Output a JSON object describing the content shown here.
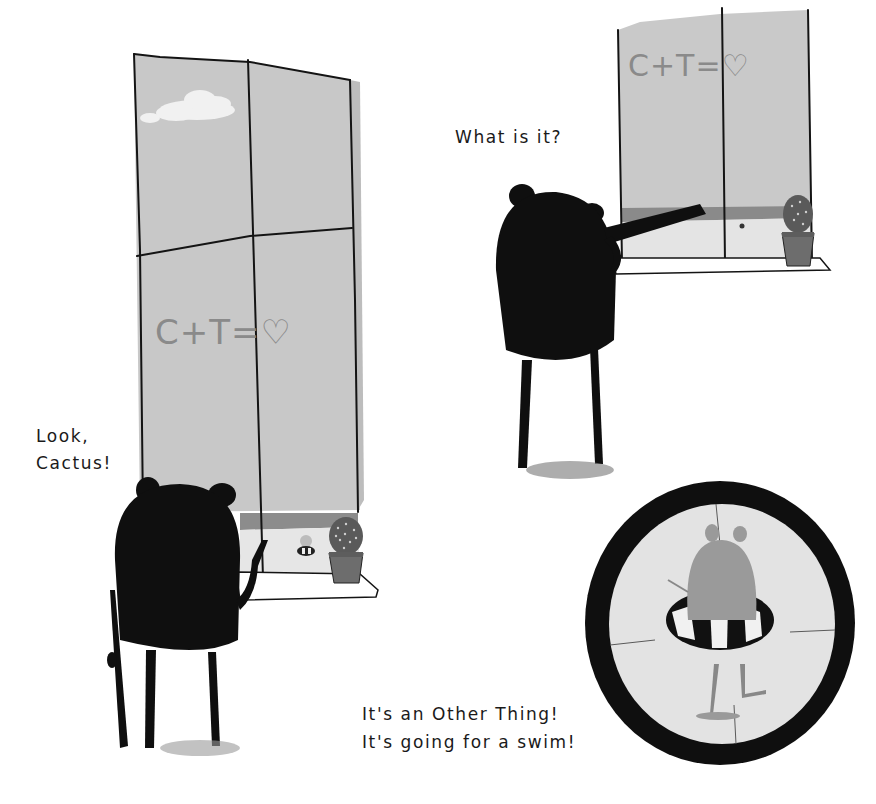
{
  "page": {
    "type": "picture-book spread",
    "captions": {
      "look": {
        "line1": "Look,",
        "line2": "Cactus!"
      },
      "what": {
        "line1": "What is it?"
      },
      "other": {
        "line1": "It's an Other Thing!",
        "line2": "It's going for a swim!"
      }
    },
    "window_graffiti": "C+T=♡",
    "scenes": [
      {
        "name": "window-left",
        "description": "Tall window with cloud, beach view, bear pointing, cactus pot"
      },
      {
        "name": "window-right",
        "description": "Window with bear looking through telescope, cactus pot"
      },
      {
        "name": "telescope-view",
        "description": "Circular telescope view of creature in striped swim ring"
      }
    ],
    "colors": {
      "ink": "#111111",
      "window_glass": "#c9c9c9",
      "sea": "#8a8a8a",
      "sand": "#e4e4e4",
      "paper": "#ffffff",
      "creature": "#9a9a9a"
    }
  }
}
